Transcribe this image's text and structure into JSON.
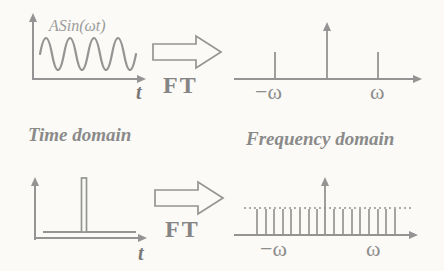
{
  "colors": {
    "line": "#949494",
    "text": "#858585",
    "background": "#fbfaf6"
  },
  "top_row": {
    "time_plot": {
      "signal_label": "ASin(ωt)",
      "axis_label": "t"
    },
    "ft_label": "FT",
    "freq_plot": {
      "neg_freq_label": "−ω",
      "pos_freq_label": "ω"
    }
  },
  "captions": {
    "time": "Time domain",
    "frequency": "Frequency domain"
  },
  "bottom_row": {
    "time_plot": {
      "axis_label": "t"
    },
    "ft_label": "FT",
    "freq_plot": {
      "neg_freq_label": "−ω",
      "pos_freq_label": "ω"
    }
  }
}
